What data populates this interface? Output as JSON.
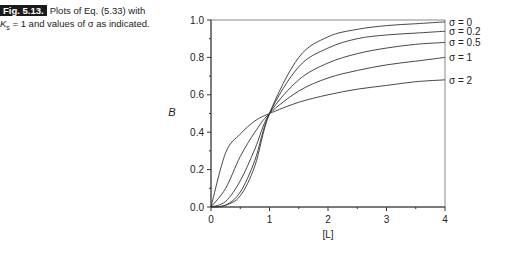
{
  "caption": {
    "label": "Fig. 5.13.",
    "line1": "Plots of Eq. (5.33) with",
    "line2": "K",
    "line2_sub": "s",
    "line2_rest": " = 1 and values of σ as indicated."
  },
  "chart_data": {
    "type": "line",
    "title": "",
    "xlabel": "[L]",
    "ylabel": "B",
    "xlim": [
      0,
      4
    ],
    "ylim": [
      0,
      1.0
    ],
    "xticks": [
      "0",
      "1",
      "2",
      "3",
      "4"
    ],
    "yticks": [
      "0.0",
      "0.2",
      "0.4",
      "0.6",
      "0.8",
      "1.0"
    ],
    "grid": false,
    "legend_position": "right-inline",
    "x": [
      0,
      0.25,
      0.5,
      0.75,
      1,
      1.5,
      2,
      2.5,
      3,
      3.5,
      4
    ],
    "series": [
      {
        "name": "σ = 0",
        "values": [
          0,
          0.01,
          0.06,
          0.22,
          0.5,
          0.8,
          0.91,
          0.95,
          0.97,
          0.98,
          0.99
        ]
      },
      {
        "name": "σ = 0.2",
        "values": [
          0,
          0.01,
          0.08,
          0.25,
          0.5,
          0.75,
          0.85,
          0.9,
          0.92,
          0.93,
          0.94
        ]
      },
      {
        "name": "σ = 0.5",
        "values": [
          0,
          0.03,
          0.14,
          0.31,
          0.5,
          0.68,
          0.77,
          0.82,
          0.85,
          0.87,
          0.88
        ]
      },
      {
        "name": "σ = 1",
        "values": [
          0,
          0.1,
          0.27,
          0.4,
          0.5,
          0.62,
          0.69,
          0.73,
          0.76,
          0.78,
          0.8
        ]
      },
      {
        "name": "σ = 2",
        "values": [
          0,
          0.29,
          0.39,
          0.46,
          0.5,
          0.56,
          0.6,
          0.63,
          0.65,
          0.67,
          0.68
        ]
      }
    ]
  }
}
